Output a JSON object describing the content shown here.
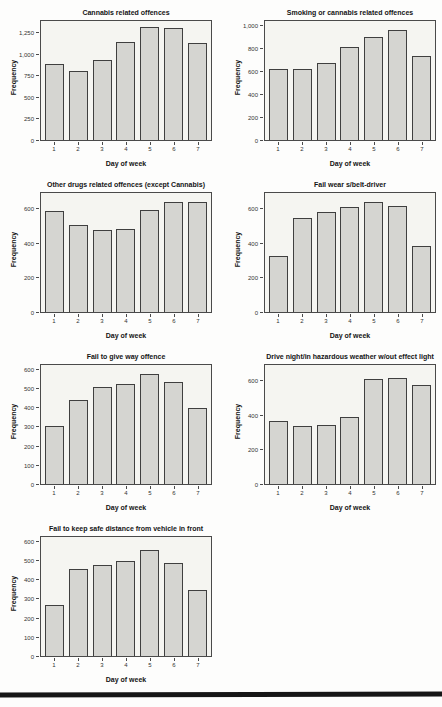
{
  "page": {
    "background_color": "#fdfdfc",
    "footer_bar_color": "#161616"
  },
  "chart_style": {
    "bar_fill": "#d5d5d1",
    "bar_border": "#3f3f3f",
    "plot_background": "#f5f5f1",
    "frame_color": "#4a4a4a"
  },
  "chart_data": [
    {
      "type": "bar",
      "title": "Cannabis related offences",
      "xlabel": "Day of week",
      "ylabel": "Frequency",
      "categories": [
        "1",
        "2",
        "3",
        "4",
        "5",
        "6",
        "7"
      ],
      "values": [
        900,
        810,
        945,
        1150,
        1330,
        1320,
        1140
      ],
      "ylim": [
        0,
        1400
      ],
      "yticks": [
        {
          "v": 0,
          "label": "0"
        },
        {
          "v": 250,
          "label": "250"
        },
        {
          "v": 500,
          "label": "500"
        },
        {
          "v": 750,
          "label": "750"
        },
        {
          "v": 1000,
          "label": "1,000"
        },
        {
          "v": 1250,
          "label": "1,250"
        }
      ],
      "grid": false,
      "legend": "none"
    },
    {
      "type": "bar",
      "title": "Smoking or cannabis related offences",
      "xlabel": "Day of week",
      "ylabel": "Frequency",
      "categories": [
        "1",
        "2",
        "3",
        "4",
        "5",
        "6",
        "7"
      ],
      "values": [
        630,
        625,
        680,
        825,
        910,
        975,
        745
      ],
      "ylim": [
        0,
        1050
      ],
      "yticks": [
        {
          "v": 0,
          "label": "0"
        },
        {
          "v": 200,
          "label": "200"
        },
        {
          "v": 400,
          "label": "400"
        },
        {
          "v": 600,
          "label": "600"
        },
        {
          "v": 800,
          "label": "800"
        },
        {
          "v": 1000,
          "label": "1,000"
        }
      ],
      "grid": false,
      "legend": "none"
    },
    {
      "type": "bar",
      "title": "Other drugs related offences (except Cannabis)",
      "xlabel": "Day of week",
      "ylabel": "Frequency",
      "categories": [
        "1",
        "2",
        "3",
        "4",
        "5",
        "6",
        "7"
      ],
      "values": [
        595,
        510,
        485,
        490,
        600,
        650,
        650
      ],
      "ylim": [
        0,
        700
      ],
      "yticks": [
        {
          "v": 0,
          "label": "0"
        },
        {
          "v": 200,
          "label": "200"
        },
        {
          "v": 400,
          "label": "400"
        },
        {
          "v": 600,
          "label": "600"
        }
      ],
      "grid": false,
      "legend": "none"
    },
    {
      "type": "bar",
      "title": "Fail wear s/belt-driver",
      "xlabel": "Day of week",
      "ylabel": "Frequency",
      "categories": [
        "1",
        "2",
        "3",
        "4",
        "5",
        "6",
        "7"
      ],
      "values": [
        330,
        555,
        590,
        620,
        645,
        625,
        390
      ],
      "ylim": [
        0,
        700
      ],
      "yticks": [
        {
          "v": 0,
          "label": "0"
        },
        {
          "v": 200,
          "label": "200"
        },
        {
          "v": 400,
          "label": "400"
        },
        {
          "v": 600,
          "label": "600"
        }
      ],
      "grid": false,
      "legend": "none"
    },
    {
      "type": "bar",
      "title": "Fail to give way offence",
      "xlabel": "Day of week",
      "ylabel": "Frequency",
      "categories": [
        "1",
        "2",
        "3",
        "4",
        "5",
        "6",
        "7"
      ],
      "values": [
        305,
        445,
        515,
        530,
        585,
        540,
        405
      ],
      "ylim": [
        0,
        630
      ],
      "yticks": [
        {
          "v": 0,
          "label": "0"
        },
        {
          "v": 100,
          "label": "100"
        },
        {
          "v": 200,
          "label": "200"
        },
        {
          "v": 300,
          "label": "300"
        },
        {
          "v": 400,
          "label": "400"
        },
        {
          "v": 500,
          "label": "500"
        },
        {
          "v": 600,
          "label": "600"
        }
      ],
      "grid": false,
      "legend": "none"
    },
    {
      "type": "bar",
      "title": "Drive night/in hazardous weather w/out effect light",
      "xlabel": "Day of week",
      "ylabel": "Frequency",
      "categories": [
        "1",
        "2",
        "3",
        "4",
        "5",
        "6",
        "7"
      ],
      "values": [
        370,
        340,
        348,
        395,
        618,
        625,
        583
      ],
      "ylim": [
        0,
        700
      ],
      "yticks": [
        {
          "v": 0,
          "label": "0"
        },
        {
          "v": 200,
          "label": "200"
        },
        {
          "v": 400,
          "label": "400"
        },
        {
          "v": 600,
          "label": "600"
        }
      ],
      "grid": false,
      "legend": "none"
    },
    {
      "type": "bar",
      "title": "Fail to keep safe distance from vehicle in front",
      "xlabel": "Day of week",
      "ylabel": "Frequency",
      "categories": [
        "1",
        "2",
        "3",
        "4",
        "5",
        "6",
        "7"
      ],
      "values": [
        268,
        463,
        483,
        502,
        560,
        494,
        350
      ],
      "ylim": [
        0,
        630
      ],
      "yticks": [
        {
          "v": 0,
          "label": "0"
        },
        {
          "v": 100,
          "label": "100"
        },
        {
          "v": 200,
          "label": "200"
        },
        {
          "v": 300,
          "label": "300"
        },
        {
          "v": 400,
          "label": "400"
        },
        {
          "v": 500,
          "label": "500"
        },
        {
          "v": 600,
          "label": "600"
        }
      ],
      "grid": false,
      "legend": "none"
    }
  ]
}
